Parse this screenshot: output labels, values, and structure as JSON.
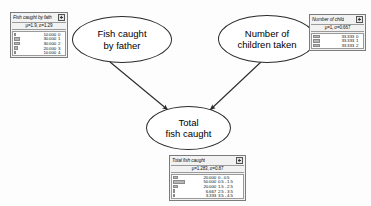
{
  "diagram": {
    "nodes": [
      {
        "id": "father",
        "label": "Fish caught\nby father"
      },
      {
        "id": "children",
        "label": "Number of\nchildren taken"
      },
      {
        "id": "total",
        "label": "Total\nfish caught"
      }
    ],
    "edges": [
      {
        "from": "father",
        "to": "total"
      },
      {
        "from": "children",
        "to": "total"
      }
    ]
  },
  "monitors": {
    "father": {
      "title": "Fish caught by fath",
      "stats": "μ=1.9, σ=1.29",
      "close_icon": "close-icon",
      "rows": [
        {
          "value": "10.000",
          "state": "0",
          "pct": 10
        },
        {
          "value": "30.000",
          "state": "1",
          "pct": 30
        },
        {
          "value": "30.000",
          "state": "2",
          "pct": 30
        },
        {
          "value": "20.000",
          "state": "3",
          "pct": 20
        },
        {
          "value": "10.000",
          "state": "4",
          "pct": 10
        }
      ]
    },
    "children": {
      "title": "Number of child",
      "stats": "μ=1, σ=0.667",
      "close_icon": "close-icon",
      "rows": [
        {
          "value": "33.333",
          "state": "0",
          "pct": 33.333
        },
        {
          "value": "33.333",
          "state": "1",
          "pct": 33.333
        },
        {
          "value": "33.333",
          "state": "2",
          "pct": 33.333
        }
      ]
    },
    "total": {
      "title": "Total fish caught",
      "stats": "μ=1.283, σ=0.87",
      "close_icon": "close-icon",
      "rows": [
        {
          "value": "20.000",
          "state": "0 - 0.5",
          "pct": 20
        },
        {
          "value": "50.000",
          "state": "0.5 - 1.5",
          "pct": 50
        },
        {
          "value": "20.000",
          "state": "1.5 - 2.5",
          "pct": 20
        },
        {
          "value": "6.667",
          "state": "2.5 - 3.5",
          "pct": 6.667
        },
        {
          "value": "3.333",
          "state": "3.5 - 4.5",
          "pct": 3.333
        }
      ]
    }
  },
  "chart_data": {
    "type": "bar",
    "charts": [
      {
        "name": "Fish caught by father",
        "categories": [
          "0",
          "1",
          "2",
          "3",
          "4"
        ],
        "values": [
          10.0,
          30.0,
          30.0,
          20.0,
          10.0
        ],
        "mean": 1.9,
        "stdev": 1.29,
        "ylabel": "probability (%)",
        "xlabel": "state"
      },
      {
        "name": "Number of children",
        "categories": [
          "0",
          "1",
          "2"
        ],
        "values": [
          33.333,
          33.333,
          33.333
        ],
        "mean": 1,
        "stdev": 0.667,
        "ylabel": "probability (%)",
        "xlabel": "state"
      },
      {
        "name": "Total fish caught",
        "categories": [
          "0 - 0.5",
          "0.5 - 1.5",
          "1.5 - 2.5",
          "2.5 - 3.5",
          "3.5 - 4.5"
        ],
        "values": [
          20.0,
          50.0,
          20.0,
          6.667,
          3.333
        ],
        "mean": 1.283,
        "stdev": 0.87,
        "ylabel": "probability (%)",
        "xlabel": "interval"
      }
    ]
  }
}
